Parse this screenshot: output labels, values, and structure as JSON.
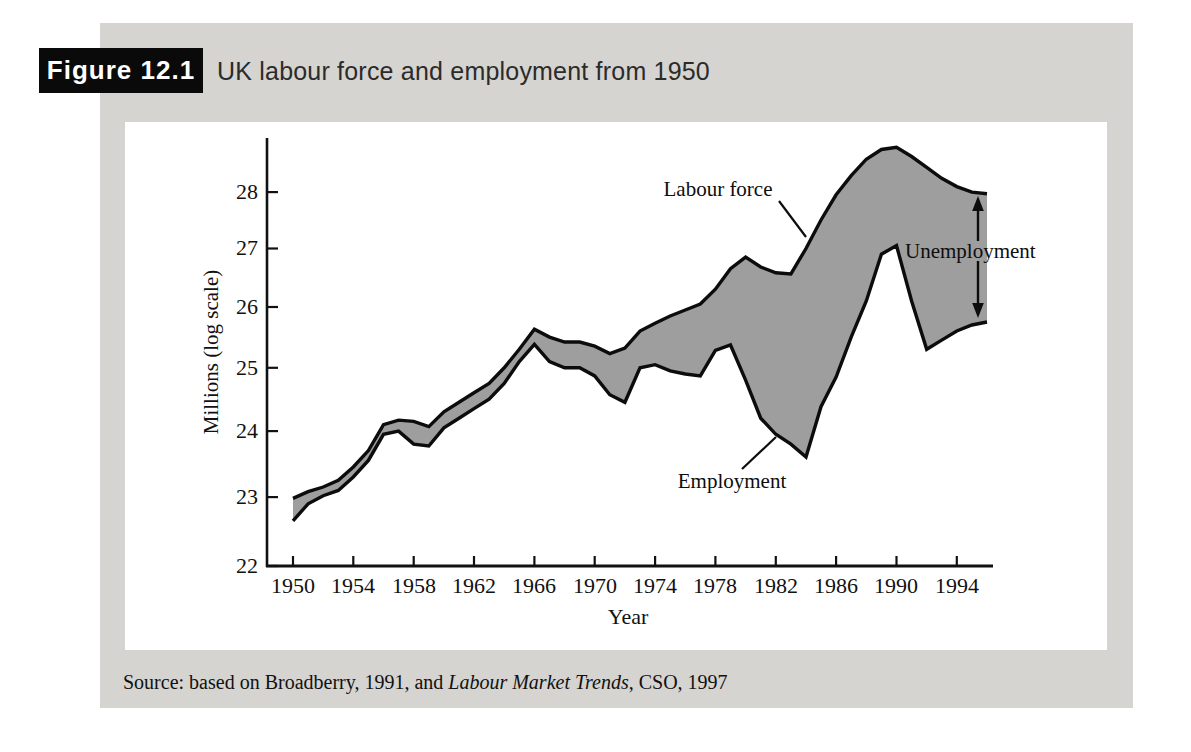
{
  "figure": {
    "label": "Figure 12.1",
    "title": "UK labour force and employment from 1950"
  },
  "chart": {
    "y_axis_label": "Millions (log scale)",
    "x_axis_label": "Year",
    "y_ticks": [
      28,
      27,
      26,
      25,
      24,
      23,
      22
    ],
    "x_ticks": [
      1950,
      1954,
      1958,
      1962,
      1966,
      1970,
      1974,
      1978,
      1982,
      1986,
      1990,
      1994
    ],
    "annotations": {
      "labour_force": "Labour force",
      "employment": "Employment",
      "unemployment": "Unemployment"
    }
  },
  "source": {
    "prefix": "Source: based on Broadberry, 1991, and ",
    "italic": "Labour Market Trends",
    "suffix": ", CSO, 1997"
  },
  "colors": {
    "panel_bg": "#d5d4d0",
    "band_fill": "#9e9e9e",
    "line_color": "#0c0c0c",
    "figure_box_bg": "#0a0a0a",
    "figure_box_text": "#ffffff"
  },
  "chart_data": {
    "type": "area",
    "title": "UK labour force and employment from 1950",
    "xlabel": "Year",
    "ylabel": "Millions (log scale)",
    "y_scale": "log",
    "ylim": [
      22,
      29
    ],
    "xlim": [
      1950,
      1996
    ],
    "grid": false,
    "band_label": "Unemployment",
    "x": [
      1950,
      1951,
      1952,
      1953,
      1954,
      1955,
      1956,
      1957,
      1958,
      1959,
      1960,
      1961,
      1962,
      1963,
      1964,
      1965,
      1966,
      1967,
      1968,
      1969,
      1970,
      1971,
      1972,
      1973,
      1974,
      1975,
      1976,
      1977,
      1978,
      1979,
      1980,
      1981,
      1982,
      1983,
      1984,
      1985,
      1986,
      1987,
      1988,
      1989,
      1990,
      1991,
      1992,
      1993,
      1994,
      1995,
      1996
    ],
    "series": [
      {
        "name": "Labour force",
        "values": [
          22.98,
          23.08,
          23.15,
          23.25,
          23.45,
          23.7,
          24.1,
          24.17,
          24.15,
          24.07,
          24.3,
          24.45,
          24.6,
          24.75,
          25.0,
          25.3,
          25.63,
          25.5,
          25.42,
          25.42,
          25.35,
          25.23,
          25.32,
          25.6,
          25.73,
          25.85,
          25.95,
          26.05,
          26.3,
          26.65,
          26.85,
          26.68,
          26.58,
          26.56,
          27.0,
          27.5,
          27.95,
          28.3,
          28.6,
          28.78,
          28.82,
          28.65,
          28.45,
          28.25,
          28.1,
          28.0,
          27.97
        ]
      },
      {
        "name": "Employment",
        "values": [
          22.65,
          22.9,
          23.02,
          23.1,
          23.3,
          23.55,
          23.95,
          24.0,
          23.8,
          23.77,
          24.05,
          24.2,
          24.35,
          24.5,
          24.75,
          25.1,
          25.38,
          25.1,
          25.0,
          25.0,
          24.87,
          24.57,
          24.45,
          25.0,
          25.05,
          24.95,
          24.9,
          24.87,
          25.28,
          25.37,
          24.8,
          24.2,
          23.95,
          23.8,
          23.6,
          24.38,
          24.85,
          25.5,
          26.1,
          26.9,
          27.05,
          26.1,
          25.3,
          25.45,
          25.6,
          25.7,
          25.75
        ]
      }
    ]
  }
}
